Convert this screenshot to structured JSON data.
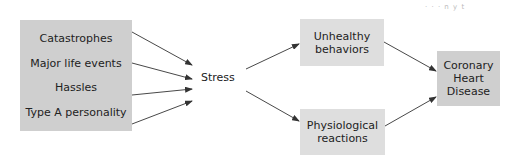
{
  "header_mark": "· · · n y t",
  "diagram": {
    "sources_box": {
      "items": [
        "Catastrophes",
        "Major life events",
        "Hassles",
        "Type A personality"
      ]
    },
    "mediator": "Stress",
    "pathways": [
      {
        "line1": "Unhealthy",
        "line2": "behaviors"
      },
      {
        "line1": "Physiological",
        "line2": "reactions"
      }
    ],
    "outcome": {
      "line1": "Coronary",
      "line2": "Heart",
      "line3": "Disease"
    },
    "edges": [
      {
        "from": "Catastrophes",
        "to": "Stress"
      },
      {
        "from": "Major life events",
        "to": "Stress"
      },
      {
        "from": "Hassles",
        "to": "Stress"
      },
      {
        "from": "Type A personality",
        "to": "Stress"
      },
      {
        "from": "Stress",
        "to": "Unhealthy behaviors"
      },
      {
        "from": "Stress",
        "to": "Physiological reactions"
      },
      {
        "from": "Unhealthy behaviors",
        "to": "Coronary Heart Disease"
      },
      {
        "from": "Physiological reactions",
        "to": "Coronary Heart Disease"
      }
    ],
    "colors": {
      "box_dark": "#cfcfcf",
      "box_light": "#dedede",
      "arrow": "#333333",
      "text": "#222222"
    }
  }
}
